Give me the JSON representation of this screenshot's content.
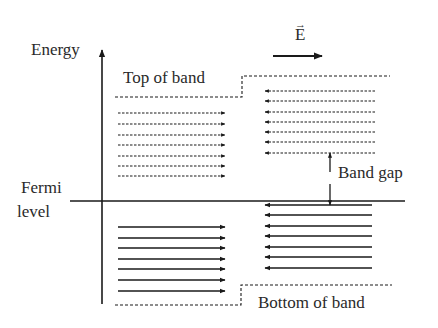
{
  "labels": {
    "energy": "Energy",
    "field": "E",
    "top_of_band": "Top of band",
    "band_gap": "Band gap",
    "fermi_line1": "Fermi",
    "fermi_line2": "level",
    "bottom_of_band": "Bottom of band"
  },
  "colors": {
    "line": "#1a1a1a",
    "text": "#2a2a2a",
    "background": "#ffffff"
  },
  "diagram": {
    "axis": {
      "x": 102,
      "y_top": 50,
      "y_bottom": 304
    },
    "fermi_line": {
      "y": 201,
      "x_start": 70,
      "x_end": 405
    },
    "field_arrow": {
      "x_start": 273,
      "x_end": 322,
      "y": 56
    },
    "top_band_edge": {
      "left_y": 97,
      "right_y": 76,
      "x_start": 115,
      "x_step": 242,
      "x_end": 390
    },
    "bottom_band_edge": {
      "left_y": 305,
      "right_y": 285,
      "x_start": 115,
      "x_step": 241,
      "x_end": 392
    },
    "upper_left_arrows": {
      "style": "dotted",
      "direction": "right",
      "x_start": 118,
      "x_end": 225,
      "y": [
        113,
        124,
        135,
        145,
        156,
        166,
        176
      ]
    },
    "upper_right_arrows": {
      "style": "dotted",
      "direction": "left",
      "x_start": 375,
      "x_end": 265,
      "y": [
        91,
        101,
        112,
        122,
        132,
        142,
        153
      ]
    },
    "lower_left_arrows": {
      "style": "solid",
      "direction": "right",
      "x_start": 118,
      "x_end": 225,
      "y": [
        227,
        238,
        248,
        259,
        269,
        280,
        291
      ]
    },
    "lower_right_arrows": {
      "style": "solid",
      "direction": "left",
      "x_start": 372,
      "x_end": 265,
      "y": [
        205,
        215,
        226,
        236,
        247,
        257,
        268
      ]
    },
    "band_gap_marker": {
      "x": 330,
      "up_from": 172,
      "up_to": 153,
      "down_from": 184,
      "down_to": 205
    }
  }
}
